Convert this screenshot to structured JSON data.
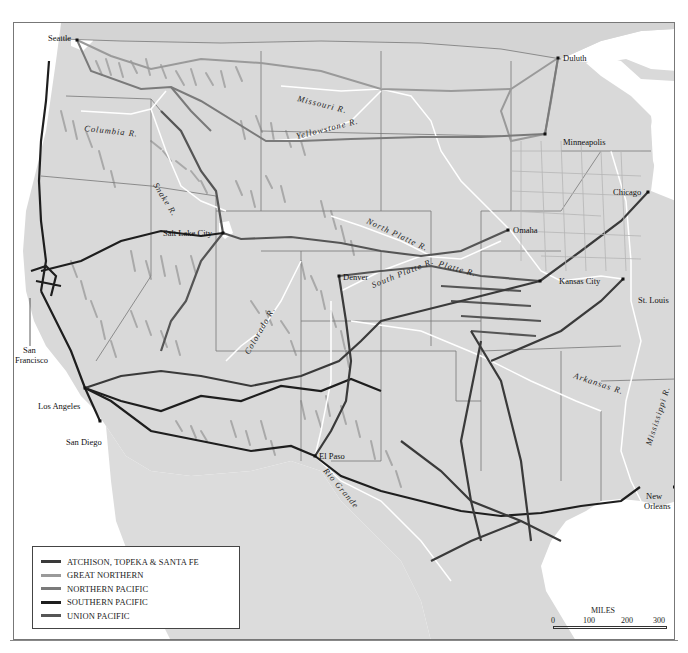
{
  "map": {
    "land_color": "#d9d9d9",
    "water_color": "#ffffff",
    "relief_color": "#a9a9a9",
    "border_color": "#777777"
  },
  "cities": [
    {
      "name": "Seattle",
      "x": 76,
      "y": 39
    },
    {
      "name": "Duluth",
      "x": 557,
      "y": 57
    },
    {
      "name": "Minneapolis",
      "x": 544,
      "y": 133
    },
    {
      "name": "Chicago",
      "x": 647,
      "y": 191
    },
    {
      "name": "Salt Lake City",
      "x": 222,
      "y": 232
    },
    {
      "name": "Omaha",
      "x": 507,
      "y": 229
    },
    {
      "name": "Denver",
      "x": 338,
      "y": 275
    },
    {
      "name": "Kansas City",
      "x": 539,
      "y": 280
    },
    {
      "name": "St. Louis",
      "x": 622,
      "y": 278
    },
    {
      "name": "San Francisco",
      "x": 19,
      "y": 278
    },
    {
      "name": "Los Angeles",
      "x": 84,
      "y": 387
    },
    {
      "name": "San Diego",
      "x": 99,
      "y": 420
    },
    {
      "name": "El Paso",
      "x": 314,
      "y": 455
    },
    {
      "name": "New Orleans",
      "x": 639,
      "y": 486
    }
  ],
  "city_labels": {
    "seattle": "Seattle",
    "duluth": "Duluth",
    "minneapolis": "Minneapolis",
    "chicago": "Chicago",
    "salt_lake_city": "Salt Lake City",
    "omaha": "Omaha",
    "denver": "Denver",
    "kansas_city": "Kansas City",
    "st_louis": "St. Louis",
    "san_francisco_1": "San",
    "san_francisco_2": "Francisco",
    "los_angeles": "Los Angeles",
    "san_diego": "San Diego",
    "el_paso": "El Paso",
    "new_orleans_1": "New",
    "new_orleans_2": "Orleans"
  },
  "river_labels": {
    "columbia": "Columbia R.",
    "missouri": "Missouri R.",
    "yellowstone": "Yellowstone R.",
    "snake": "Snake R.",
    "north_platte": "North Platte R.",
    "south_platte": "South Platte R.",
    "platte": "Platte R.",
    "colorado": "Colorado R.",
    "arkansas": "Arkansas R.",
    "mississippi": "Mississippi R.",
    "rio_grande": "Rio Grande"
  },
  "legend": {
    "items": [
      {
        "label": "ATCHISON, TOPEKA & SANTA FE",
        "color": "#3a3a3a"
      },
      {
        "label": "GREAT NORTHERN",
        "color": "#9a9a9a"
      },
      {
        "label": "NORTHERN PACIFIC",
        "color": "#7a7a7a"
      },
      {
        "label": "SOUTHERN PACIFIC",
        "color": "#1e1e1e"
      },
      {
        "label": "UNION PACIFIC",
        "color": "#555555"
      }
    ]
  },
  "scale": {
    "title": "MILES",
    "ticks": [
      "0",
      "100",
      "200",
      "300"
    ]
  }
}
